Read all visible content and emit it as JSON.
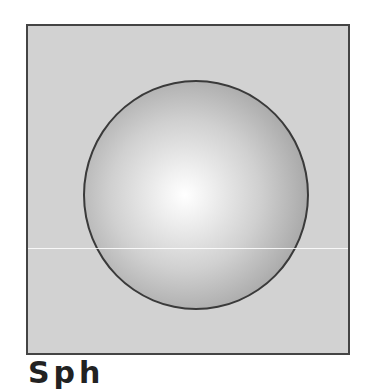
{
  "figure": {
    "colors": {
      "frame_fill": "#d2d2d2",
      "frame_border": "#444444",
      "sphere_highlight": "#ffffff",
      "sphere_edge": "#8a8a8a"
    }
  },
  "caption": {
    "text": "Sph"
  }
}
